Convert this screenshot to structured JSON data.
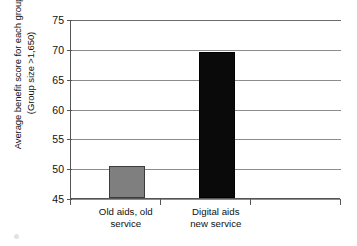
{
  "chart_data": {
    "type": "bar",
    "title": "",
    "subtitle": "",
    "xlabel": "",
    "ylabel": "Average benefit score for each group\n(Group size >1,650)",
    "categories": [
      "Old aids, old\nservice",
      "Digital aids\nnew service"
    ],
    "values": [
      50.4,
      69.5
    ],
    "series": [
      {
        "name": "Average benefit score",
        "values": [
          50.4,
          69.5
        ],
        "colors": [
          "#7f7f7f",
          "#0a0a0a"
        ]
      }
    ],
    "ylim": [
      45,
      75
    ],
    "y_ticks": [
      45,
      50,
      55,
      60,
      65,
      70,
      75
    ],
    "y_tick_labels": [
      "45",
      "50",
      "55",
      "60",
      "65",
      "70",
      "75"
    ],
    "grid": true,
    "grid_axis": "y",
    "legend": false,
    "legend_position": "none",
    "annotations": [],
    "colors": {
      "bar_old": "#7f7f7f",
      "bar_new": "#0a0a0a",
      "gridline": "#8c8c8c",
      "axis": "#555555",
      "background": "#ffffff",
      "text": "#111111"
    }
  }
}
